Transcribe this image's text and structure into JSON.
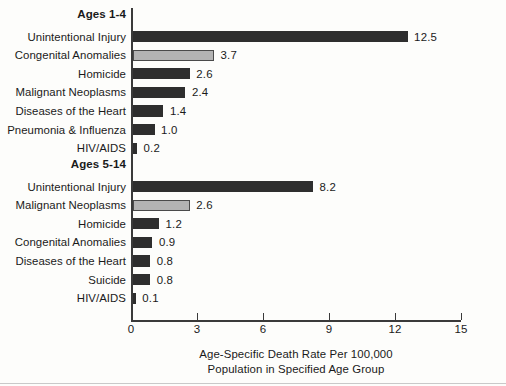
{
  "chart_data": {
    "type": "bar",
    "orientation": "horizontal",
    "title": "",
    "xlabel": "Age-Specific Death Rate Per 100,000 Population in Specified Age Group",
    "ylabel": "",
    "xlim": [
      0,
      15
    ],
    "xticks": [
      0,
      3,
      6,
      9,
      12,
      15
    ],
    "grid": false,
    "legend": false,
    "value_label_format": "one-decimal",
    "panels": [
      {
        "heading": "Ages 1-4",
        "categories": [
          "Unintentional Injury",
          "Congenital Anomalies",
          "Homicide",
          "Malignant Neoplasms",
          "Diseases of the Heart",
          "Pneumonia & Influenza",
          "HIV/AIDS"
        ],
        "values": [
          12.5,
          3.7,
          2.6,
          2.4,
          1.4,
          1.0,
          0.2
        ],
        "value_labels": [
          "12.5",
          "3.7",
          "2.6",
          "2.4",
          "1.4",
          "1.0",
          "0.2"
        ],
        "highlighted": [
          false,
          true,
          false,
          false,
          false,
          false,
          false
        ]
      },
      {
        "heading": "Ages 5-14",
        "categories": [
          "Unintentional Injury",
          "Malignant Neoplasms",
          "Homicide",
          "Congenital Anomalies",
          "Diseases of the Heart",
          "Suicide",
          "HIV/AIDS"
        ],
        "values": [
          8.2,
          2.6,
          1.2,
          0.9,
          0.8,
          0.8,
          0.1
        ],
        "value_labels": [
          "8.2",
          "2.6",
          "1.2",
          "0.9",
          "0.8",
          "0.8",
          "0.1"
        ],
        "highlighted": [
          false,
          true,
          false,
          false,
          false,
          false,
          false
        ]
      }
    ],
    "caption_lines": [
      "Age-Specific Death Rate Per 100,000",
      "Population in Specified Age Group"
    ],
    "colors": {
      "bar_dark": "#2e2e2e",
      "bar_highlight": "#b3b3b3",
      "bar_highlight_border": "#4a4a4a",
      "axis": "#3a3a3a",
      "text": "#1a1a1a",
      "background": "#fdfdfb"
    }
  }
}
